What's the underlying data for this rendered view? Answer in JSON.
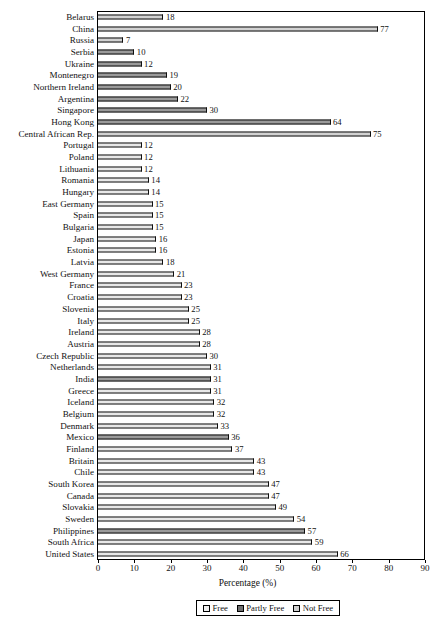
{
  "chart_data": {
    "type": "bar",
    "orientation": "horizontal",
    "title": "",
    "xlabel": "Percentage (%)",
    "ylabel": "",
    "xlim": [
      0,
      90
    ],
    "xticks": [
      0,
      10,
      20,
      30,
      40,
      50,
      60,
      70,
      80,
      90
    ],
    "grid": false,
    "legend_position": "bottom",
    "legend": [
      "Free",
      "Partly Free",
      "Not Free"
    ],
    "categories": [
      "Belarus",
      "China",
      "Russia",
      "Serbia",
      "Ukraine",
      "Montenegro",
      "Northern Ireland",
      "Argentina",
      "Singapore",
      "Hong Kong",
      "Central African Rep.",
      "Portugal",
      "Poland",
      "Lithuania",
      "Romania",
      "Hungary",
      "East Germany",
      "Spain",
      "Bulgaria",
      "Japan",
      "Estonia",
      "Latvia",
      "West Germany",
      "France",
      "Croatia",
      "Slovenia",
      "Italy",
      "Ireland",
      "Austria",
      "Czech Republic",
      "Netherlands",
      "India",
      "Greece",
      "Iceland",
      "Belgium",
      "Denmark",
      "Mexico",
      "Finland",
      "Britain",
      "Chile",
      "South Korea",
      "Canada",
      "Slovakia",
      "Sweden",
      "Philippines",
      "South Africa",
      "United States"
    ],
    "values": [
      18,
      77,
      7,
      10,
      12,
      19,
      20,
      22,
      30,
      64,
      75,
      12,
      12,
      12,
      14,
      14,
      15,
      15,
      15,
      16,
      16,
      18,
      21,
      23,
      23,
      25,
      25,
      28,
      28,
      30,
      31,
      31,
      31,
      32,
      32,
      33,
      36,
      37,
      43,
      43,
      47,
      47,
      49,
      54,
      57,
      59,
      66
    ],
    "groups": [
      "not",
      "not",
      "not",
      "partly",
      "partly",
      "partly",
      "partly",
      "partly",
      "partly",
      "partly",
      "not",
      "free",
      "free",
      "free",
      "free",
      "free",
      "free",
      "free",
      "free",
      "free",
      "free",
      "free",
      "free",
      "free",
      "free",
      "free",
      "free",
      "free",
      "free",
      "free",
      "free",
      "partly",
      "free",
      "free",
      "free",
      "free",
      "partly",
      "free",
      "free",
      "free",
      "free",
      "free",
      "free",
      "free",
      "partly",
      "free",
      "free"
    ]
  }
}
